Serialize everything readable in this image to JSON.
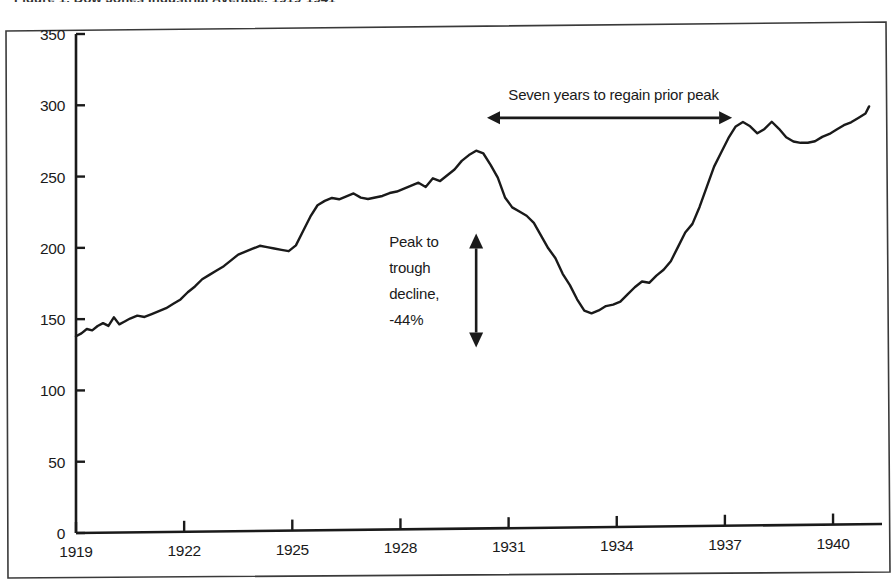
{
  "figure": {
    "clipped_top_title": "Figure 1. Dow Jones Industrial Average, 1919-1941",
    "frame_color": "#3a3a3a",
    "line_color": "#1a1a1a",
    "background": "#ffffff"
  },
  "annotations": {
    "horizontal": {
      "label": "Seven years to regain prior peak",
      "arrow": "double-headed-horizontal",
      "x_start_year": 1930.4,
      "x_end_year": 1937.2,
      "y_value": 287
    },
    "vertical": {
      "label_lines": [
        "Peak to",
        "trough",
        "decline,",
        "-44%"
      ],
      "label": "Peak to trough decline, -44%",
      "arrow": "double-headed-vertical",
      "x_year": 1930.1,
      "y_top": 207,
      "y_bottom": 127
    }
  },
  "chart_data": {
    "type": "line",
    "title": "",
    "xlabel": "",
    "ylabel": "",
    "xlim": [
      1919,
      1941.1
    ],
    "ylim": [
      0,
      350
    ],
    "grid": false,
    "legend": "none",
    "xticks": [
      1919,
      1922,
      1925,
      1928,
      1931,
      1934,
      1937,
      1940
    ],
    "xtick_labels": [
      "1919",
      "1922",
      "1925",
      "1928",
      "1931",
      "1934",
      "1937",
      "1940"
    ],
    "yticks": [
      0,
      50,
      100,
      150,
      200,
      250,
      300,
      350
    ],
    "ytick_labels": [
      "0",
      "50",
      "100",
      "150",
      "200",
      "250",
      "300",
      "350"
    ],
    "peak_value": 265,
    "trough_value": 150,
    "series": [
      {
        "name": "Index level",
        "x": [
          1919.0,
          1919.15,
          1919.3,
          1919.45,
          1919.6,
          1919.75,
          1919.9,
          1920.05,
          1920.2,
          1920.35,
          1920.5,
          1920.7,
          1920.9,
          1921.1,
          1921.3,
          1921.5,
          1921.7,
          1921.9,
          1922.1,
          1922.3,
          1922.5,
          1922.7,
          1922.9,
          1923.1,
          1923.3,
          1923.5,
          1923.7,
          1923.9,
          1924.1,
          1924.3,
          1924.5,
          1924.7,
          1924.9,
          1925.1,
          1925.3,
          1925.5,
          1925.7,
          1925.9,
          1926.1,
          1926.3,
          1926.5,
          1926.7,
          1926.9,
          1927.1,
          1927.3,
          1927.5,
          1927.7,
          1927.9,
          1928.1,
          1928.3,
          1928.5,
          1928.7,
          1928.9,
          1929.1,
          1929.3,
          1929.5,
          1929.7,
          1929.9,
          1930.1,
          1930.3,
          1930.5,
          1930.7,
          1930.9,
          1931.1,
          1931.3,
          1931.5,
          1931.7,
          1931.9,
          1932.1,
          1932.3,
          1932.5,
          1932.7,
          1932.9,
          1933.1,
          1933.3,
          1933.5,
          1933.7,
          1933.9,
          1934.1,
          1934.3,
          1934.5,
          1934.7,
          1934.9,
          1935.1,
          1935.3,
          1935.5,
          1935.7,
          1935.9,
          1936.1,
          1936.3,
          1936.5,
          1936.7,
          1936.9,
          1937.1,
          1937.3,
          1937.5,
          1937.7,
          1937.9,
          1938.1,
          1938.3,
          1938.5,
          1938.7,
          1938.9,
          1939.1,
          1939.3,
          1939.5,
          1939.7,
          1939.9,
          1940.1,
          1940.3,
          1940.5,
          1940.7,
          1940.9,
          1941.0
        ],
        "y": [
          138,
          140,
          143,
          142,
          145,
          147,
          145,
          151,
          146,
          148,
          150,
          152,
          151,
          153,
          155,
          157,
          160,
          163,
          168,
          172,
          177,
          180,
          183,
          186,
          190,
          194,
          196,
          198,
          200,
          199,
          198,
          197,
          196,
          200,
          210,
          220,
          228,
          231,
          233,
          232,
          234,
          236,
          233,
          232,
          233,
          234,
          236,
          237,
          239,
          241,
          243,
          240,
          246,
          244,
          248,
          252,
          258,
          262,
          265,
          263,
          255,
          246,
          232,
          225,
          222,
          219,
          214,
          205,
          196,
          189,
          178,
          170,
          160,
          152,
          150,
          152,
          155,
          156,
          158,
          163,
          168,
          172,
          171,
          176,
          180,
          186,
          196,
          206,
          212,
          224,
          238,
          252,
          262,
          272,
          280,
          283,
          280,
          275,
          278,
          283,
          278,
          272,
          269,
          268,
          268,
          269,
          272,
          274,
          277,
          280,
          282,
          285,
          288,
          293
        ]
      }
    ]
  }
}
